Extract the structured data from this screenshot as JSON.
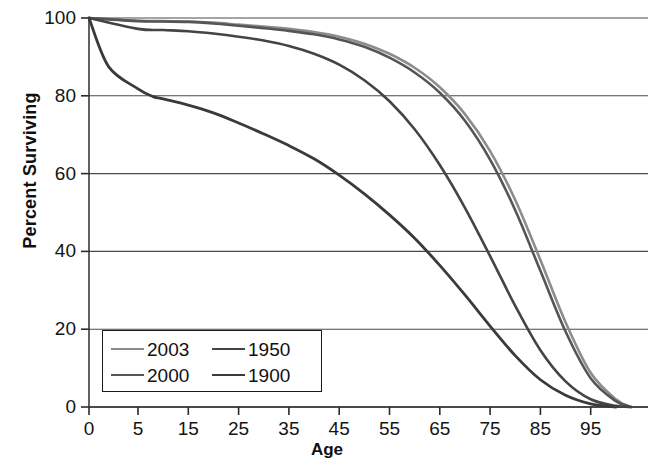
{
  "chart_data": {
    "type": "line",
    "title": "",
    "xlabel": "Age",
    "ylabel": "Percent Surviving",
    "xlim": [
      0,
      105
    ],
    "ylim": [
      0,
      100
    ],
    "grid": "horizontal",
    "legend_position": "bottom-left",
    "x_ticks": [
      0,
      5,
      15,
      25,
      35,
      45,
      55,
      65,
      75,
      85,
      95
    ],
    "x_tick_labels": [
      "0",
      "5",
      "15",
      "25",
      "35",
      "45",
      "55",
      "65",
      "75",
      "85",
      "95"
    ],
    "y_ticks": [
      0,
      20,
      40,
      60,
      80,
      100
    ],
    "y_tick_labels": [
      "0",
      "20",
      "40",
      "60",
      "80",
      "100"
    ],
    "series": [
      {
        "name": "2003",
        "color": "#8c8c8c",
        "width": 2.6,
        "x": [
          0,
          5,
          10,
          15,
          20,
          25,
          30,
          35,
          40,
          45,
          50,
          55,
          60,
          65,
          70,
          75,
          80,
          85,
          90,
          95,
          100,
          103
        ],
        "values": [
          100,
          99.3,
          99.2,
          99.1,
          98.8,
          98.3,
          97.8,
          97.2,
          96.4,
          95.2,
          93.4,
          90.8,
          87.2,
          82.2,
          75.3,
          65.8,
          53.2,
          37.8,
          21.8,
          8.8,
          2.0,
          0
        ]
      },
      {
        "name": "2000",
        "color": "#555555",
        "width": 2.6,
        "x": [
          0,
          5,
          10,
          15,
          20,
          25,
          30,
          35,
          40,
          45,
          50,
          55,
          60,
          65,
          70,
          75,
          80,
          85,
          90,
          95,
          100,
          103
        ],
        "values": [
          100,
          99.2,
          99.1,
          99.0,
          98.6,
          98.0,
          97.4,
          96.7,
          95.8,
          94.5,
          92.6,
          89.8,
          86.0,
          80.8,
          73.6,
          63.6,
          50.6,
          35.0,
          19.4,
          7.4,
          1.5,
          0
        ]
      },
      {
        "name": "1950",
        "color": "#444444",
        "width": 2.6,
        "x": [
          0,
          5,
          10,
          15,
          20,
          25,
          30,
          35,
          40,
          45,
          50,
          55,
          60,
          65,
          70,
          75,
          80,
          85,
          90,
          95,
          100,
          103
        ],
        "values": [
          100,
          97.2,
          96.9,
          96.6,
          96.0,
          95.2,
          94.2,
          92.8,
          90.8,
          88.0,
          84.0,
          78.6,
          71.4,
          62.2,
          51.2,
          38.8,
          26.0,
          14.6,
          6.6,
          2.0,
          0.3,
          0
        ]
      },
      {
        "name": "1900",
        "color": "#3a3a3a",
        "width": 2.8,
        "x": [
          0,
          2,
          5,
          8,
          10,
          15,
          20,
          25,
          30,
          35,
          40,
          45,
          50,
          55,
          60,
          65,
          70,
          75,
          80,
          85,
          90,
          95,
          100
        ],
        "values": [
          100,
          87.5,
          81.8,
          79.8,
          79.2,
          77.6,
          75.6,
          73.0,
          70.2,
          67.2,
          63.8,
          59.6,
          54.8,
          49.4,
          43.4,
          36.4,
          28.8,
          20.8,
          13.2,
          7.0,
          3.0,
          0.8,
          0
        ]
      }
    ]
  },
  "axis": {
    "x_title": "Age",
    "y_title": "Percent Surviving"
  },
  "legend": {
    "entries": [
      {
        "label": "2003"
      },
      {
        "label": "1950"
      },
      {
        "label": "2000"
      },
      {
        "label": "1900"
      }
    ]
  }
}
